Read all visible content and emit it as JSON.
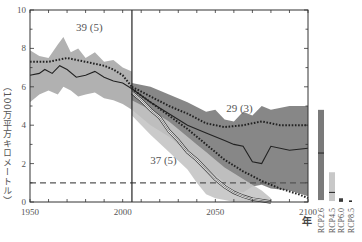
{
  "chart_data": {
    "type": "line",
    "title": "",
    "xlabel": "年",
    "ylabel": "（100万平方キロメートル）",
    "xlim": [
      1950,
      2100
    ],
    "ylim": [
      0,
      10
    ],
    "x_ticks": [
      1950,
      2000,
      2050,
      2100
    ],
    "y_ticks": [
      0,
      2,
      4,
      6,
      8,
      10
    ],
    "grid": false,
    "reference_line": {
      "y": 1,
      "style": "dashed",
      "color": "#555555"
    },
    "vertical_line": {
      "x": 2005,
      "color": "#222222"
    },
    "annotations": [
      {
        "text": "39 (5)",
        "x": 1982,
        "y": 8.9
      },
      {
        "text": "29 (3)",
        "x": 2063,
        "y": 4.7
      },
      {
        "text": "37 (5)",
        "x": 2022,
        "y": 2.0
      }
    ],
    "series": [
      {
        "name": "Historical multi-model mean",
        "style": "dotted",
        "color": "#222222",
        "x": [
          1950,
          1955,
          1960,
          1965,
          1970,
          1975,
          1980,
          1985,
          1990,
          1995,
          2000,
          2005
        ],
        "values": [
          7.3,
          7.3,
          7.3,
          7.4,
          7.5,
          7.4,
          7.3,
          7.2,
          7.1,
          6.9,
          6.6,
          6.0
        ]
      },
      {
        "name": "Historical subset mean",
        "style": "solid",
        "color": "#222222",
        "x": [
          1950,
          1955,
          1958,
          1962,
          1966,
          1970,
          1975,
          1980,
          1985,
          1990,
          1995,
          2000,
          2005
        ],
        "values": [
          6.6,
          6.7,
          6.9,
          6.7,
          7.1,
          6.9,
          6.5,
          6.6,
          6.8,
          6.5,
          6.3,
          6.2,
          5.9
        ]
      },
      {
        "name": "Historical range",
        "style": "band",
        "color": "#a8a8a8",
        "x": [
          1950,
          1955,
          1960,
          1965,
          1968,
          1972,
          1976,
          1980,
          1985,
          1990,
          1995,
          2000,
          2005
        ],
        "upper": [
          7.9,
          7.6,
          7.5,
          8.2,
          8.6,
          7.8,
          8.0,
          7.5,
          7.8,
          7.3,
          7.4,
          7.0,
          6.8
        ],
        "lower": [
          5.2,
          5.6,
          5.8,
          5.6,
          6.0,
          5.8,
          5.5,
          5.6,
          5.7,
          5.4,
          5.3,
          5.1,
          4.8
        ]
      },
      {
        "name": "RCP2.6 multi-model mean",
        "style": "dotted",
        "color": "#222222",
        "x": [
          2005,
          2015,
          2025,
          2035,
          2045,
          2055,
          2065,
          2075,
          2085,
          2095,
          2100
        ],
        "values": [
          6.0,
          5.5,
          5.0,
          4.6,
          4.1,
          3.9,
          4.0,
          4.2,
          4.0,
          4.0,
          4.0
        ]
      },
      {
        "name": "RCP2.6 subset mean",
        "style": "solid",
        "color": "#222222",
        "x": [
          2005,
          2015,
          2025,
          2035,
          2045,
          2055,
          2060,
          2065,
          2070,
          2075,
          2080,
          2090,
          2100
        ],
        "values": [
          5.9,
          5.2,
          4.6,
          4.0,
          3.6,
          3.2,
          3.0,
          2.9,
          2.1,
          2.0,
          2.9,
          2.7,
          2.8
        ]
      },
      {
        "name": "RCP2.6 range",
        "style": "band",
        "color": "#7a7a7a",
        "x": [
          2005,
          2015,
          2025,
          2035,
          2045,
          2050,
          2055,
          2060,
          2065,
          2070,
          2075,
          2080,
          2090,
          2100
        ],
        "upper": [
          6.2,
          6.0,
          5.6,
          5.2,
          4.7,
          4.8,
          4.3,
          4.2,
          4.7,
          4.5,
          5.0,
          4.8,
          5.0,
          5.0
        ],
        "lower": [
          4.8,
          4.0,
          3.4,
          2.6,
          1.8,
          1.4,
          1.0,
          0.6,
          0.5,
          0.8,
          0.9,
          0.7,
          0.6,
          0.3
        ]
      },
      {
        "name": "RCP8.5 multi-model mean",
        "style": "dotted",
        "color": "#222222",
        "x": [
          2005,
          2015,
          2025,
          2035,
          2045,
          2055,
          2065,
          2075,
          2085,
          2095,
          2100
        ],
        "values": [
          5.9,
          5.2,
          4.5,
          3.8,
          3.0,
          2.2,
          1.6,
          1.1,
          0.7,
          0.4,
          0.2
        ]
      },
      {
        "name": "RCP8.5 subset mean",
        "style": "solid-white-outlined",
        "color": "#222222",
        "x": [
          2005,
          2010,
          2015,
          2020,
          2025,
          2030,
          2035,
          2040,
          2045,
          2050,
          2055,
          2060,
          2065,
          2070,
          2080
        ],
        "values": [
          5.7,
          5.3,
          4.8,
          4.4,
          3.7,
          3.2,
          2.6,
          2.2,
          1.7,
          1.2,
          0.8,
          0.5,
          0.3,
          0.15,
          0.0
        ]
      },
      {
        "name": "RCP8.5 range",
        "style": "band",
        "color": "#c4c4c4",
        "x": [
          2005,
          2015,
          2025,
          2035,
          2040,
          2045,
          2050,
          2055,
          2060,
          2065,
          2070,
          2075,
          2080
        ],
        "upper": [
          5.3,
          4.8,
          4.2,
          3.4,
          3.0,
          2.6,
          2.2,
          1.8,
          1.5,
          1.2,
          0.9,
          0.6,
          0.2
        ],
        "lower": [
          4.5,
          3.5,
          2.6,
          1.7,
          1.0,
          0.4,
          0.2,
          0.1,
          0.0,
          0.0,
          0.0,
          0.0,
          0.0
        ]
      }
    ],
    "legend": {
      "position": "right",
      "items": [
        {
          "label": "RCP2.6",
          "color": "#7a7a7a",
          "range": [
            0.1,
            4.8
          ],
          "median": 2.55
        },
        {
          "label": "RCP4.5",
          "color": "#c8c8c8",
          "range": [
            0.05,
            1.55
          ],
          "median": 0.5
        },
        {
          "label": "RCP6.0",
          "color": "#555555",
          "range": [
            0.0,
            0.2
          ],
          "median": 0.1
        },
        {
          "label": "RCP8.5",
          "color": "#555555",
          "range": [
            0.0,
            0.08
          ],
          "median": 0.04
        }
      ]
    }
  }
}
